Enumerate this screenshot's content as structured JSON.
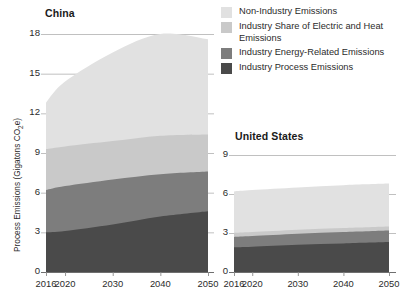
{
  "legend": {
    "entries": [
      {
        "label": "Non-Industry Emissions",
        "color": "#e1e1e1",
        "key": "non_industry"
      },
      {
        "label": "Industry Share of Electric and Heat Emissions",
        "color": "#c9c9c9",
        "key": "electric_heat"
      },
      {
        "label": "Industry Energy-Related Emissions",
        "color": "#7d7d7d",
        "key": "energy_related"
      },
      {
        "label": "Industry Process Emissions",
        "color": "#4a4a4a",
        "key": "process"
      }
    ]
  },
  "axis": {
    "ylabel_main": "Process Emissions (Gigatons CO",
    "ylabel_sub": "2",
    "ylabel_tail": "e)"
  },
  "chart_data": [
    {
      "type": "area",
      "id": "china",
      "title": "China",
      "stacked": true,
      "xlabel": "",
      "ylabel": "Process Emissions (Gigatons CO2e)",
      "x": [
        2016,
        2020,
        2030,
        2040,
        2050
      ],
      "xticks": [
        "2016",
        "2020",
        "2030",
        "2040",
        "2050"
      ],
      "yticks": [
        0,
        3,
        6,
        9,
        12,
        15,
        18
      ],
      "ylim": [
        0,
        18
      ],
      "grid": true,
      "legend_position": "top-right",
      "series": [
        {
          "name": "Industry Process Emissions",
          "color": "#4a4a4a",
          "values": [
            3.0,
            3.1,
            3.6,
            4.2,
            4.6
          ]
        },
        {
          "name": "Industry Energy-Related Emissions",
          "color": "#7d7d7d",
          "values": [
            3.2,
            3.4,
            3.4,
            3.2,
            3.0
          ]
        },
        {
          "name": "Industry Share of Electric and Heat Emissions",
          "color": "#c9c9c9",
          "values": [
            3.1,
            3.0,
            2.9,
            2.9,
            2.8
          ]
        },
        {
          "name": "Non-Industry Emissions",
          "color": "#e1e1e1",
          "values": [
            3.5,
            4.9,
            6.7,
            7.7,
            7.2
          ]
        }
      ],
      "totals": [
        12.8,
        14.4,
        16.6,
        18.0,
        17.6
      ]
    },
    {
      "type": "area",
      "id": "united_states",
      "title": "United States",
      "stacked": true,
      "xlabel": "",
      "ylabel": "",
      "x": [
        2016,
        2020,
        2030,
        2040,
        2050
      ],
      "xticks": [
        "2016",
        "2020",
        "2030",
        "2040",
        "2050"
      ],
      "yticks": [
        0,
        3,
        6,
        9
      ],
      "ylim": [
        0,
        9
      ],
      "grid": true,
      "legend_position": "shared",
      "series": [
        {
          "name": "Industry Process Emissions",
          "color": "#4a4a4a",
          "values": [
            1.9,
            1.95,
            2.1,
            2.2,
            2.3
          ]
        },
        {
          "name": "Industry Energy-Related Emissions",
          "color": "#7d7d7d",
          "values": [
            0.8,
            0.82,
            0.85,
            0.88,
            0.9
          ]
        },
        {
          "name": "Industry Share of Electric and Heat Emissions",
          "color": "#c9c9c9",
          "values": [
            0.3,
            0.3,
            0.3,
            0.3,
            0.3
          ]
        },
        {
          "name": "Non-Industry Emissions",
          "color": "#e1e1e1",
          "values": [
            3.2,
            3.23,
            3.25,
            3.3,
            3.3
          ]
        }
      ],
      "totals": [
        6.2,
        6.3,
        6.5,
        6.68,
        6.8
      ]
    }
  ]
}
